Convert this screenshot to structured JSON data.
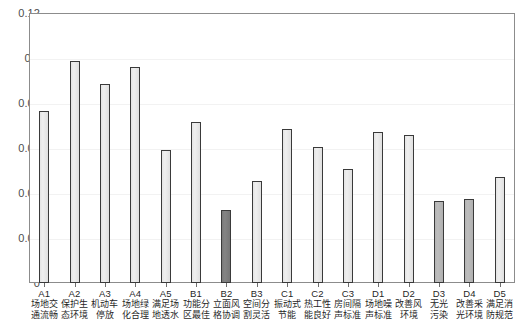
{
  "chart_data": {
    "type": "bar",
    "title": "",
    "subtitle": "",
    "xlabel": "",
    "ylabel": "",
    "ylim": [
      0,
      0.12
    ],
    "ytick_labels": [
      "0",
      "0.02",
      "0.04",
      "0.06",
      "0.08",
      "0.1",
      "0.12"
    ],
    "ytick_values": [
      0,
      0.02,
      0.04,
      0.06,
      0.08,
      0.1,
      0.12
    ],
    "grid": false,
    "legend": "none",
    "categories": [
      "A1",
      "A2",
      "A3",
      "A4",
      "A5",
      "B1",
      "B2",
      "B3",
      "C1",
      "C2",
      "C3",
      "D1",
      "D2",
      "D3",
      "D4",
      "D5"
    ],
    "category_descriptions": [
      "场地交通流畅",
      "保护生态环境",
      "机动车停放",
      "场地绿化合理",
      "满足场地透水",
      "功能分区最佳",
      "立面风格协调",
      "空间分割灵活",
      "振动式节能",
      "热工性能良好",
      "房间隔声标准",
      "场地噪声标准",
      "改善风环境",
      "无光污染",
      "改善采光环境",
      "满足消防规范"
    ],
    "values": [
      0.0765,
      0.0985,
      0.0885,
      0.096,
      0.059,
      0.0715,
      0.0325,
      0.0455,
      0.0685,
      0.0605,
      0.0505,
      0.067,
      0.066,
      0.0365,
      0.0375,
      0.047
    ],
    "bar_shades": [
      "light",
      "light",
      "light",
      "light",
      "light",
      "light",
      "dark",
      "light",
      "light",
      "light",
      "light",
      "light",
      "light",
      "mid",
      "mid",
      "light"
    ],
    "colors": {
      "bar_light": "#e8e8e8",
      "bar_mid": "#b8b8b8",
      "bar_dark": "#808080",
      "bar_edge": "#3a3a3a",
      "axis": "#8c8c8c",
      "text": "#1f1f1f",
      "tick_text": "#4d4d4d",
      "background": "#ffffff"
    }
  }
}
